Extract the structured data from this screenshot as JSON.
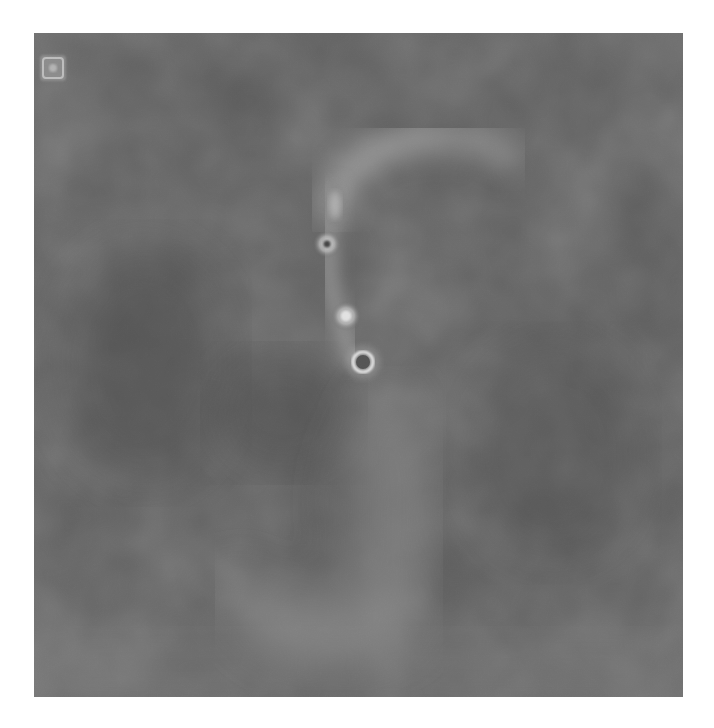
{
  "image": {
    "kind": "grayscale intensity map",
    "panel": {
      "x": 34,
      "y": 33,
      "width": 649,
      "height": 664
    },
    "background_color": "#5a5a5a",
    "background_dark_color": "#4a4a4a",
    "background_light_color": "#767676",
    "structure_color": "#9a9a9a",
    "highlight_color": "#e6e6e6"
  },
  "features": {
    "corner_marker": {
      "label": "reference marker",
      "cx": 53,
      "cy": 68,
      "size": 26
    },
    "upper_arc": {
      "label": "diffuse arc",
      "from": [
        330,
        160
      ],
      "to": [
        510,
        140
      ]
    },
    "blob_elongated": {
      "label": "elongated knot",
      "cx": 335,
      "cy": 205
    },
    "knot_ring_small": {
      "label": "compact knot with dark core",
      "cx": 327,
      "cy": 244,
      "r": 8
    },
    "blob_bright": {
      "label": "bright knot",
      "cx": 346,
      "cy": 316,
      "r": 10
    },
    "ring_target": {
      "label": "bright ring",
      "cx": 363,
      "cy": 362,
      "r": 11
    },
    "lower_lobe": {
      "label": "diffuse lower lobe",
      "cx": 320,
      "cy": 580
    }
  }
}
